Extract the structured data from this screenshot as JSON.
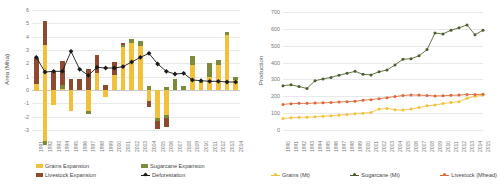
{
  "colors": {
    "grains": "#F2C13C",
    "sugarcane": "#7B8B3C",
    "livestock": "#8E4A2E",
    "deforestation": "#1a1a1a",
    "grains_line": "#F2C13C",
    "sugarcane_line": "#4A5D2B",
    "livestock_line": "#E0663A",
    "grid": "#e9e9e9",
    "axis_text": "#777777"
  },
  "left_chart": {
    "ylabel": "Area (Mha)",
    "legend": [
      {
        "label": "Grains Expansion",
        "marker": "square",
        "color": "#F2C13C"
      },
      {
        "label": "Sugarcane Expansion",
        "marker": "square",
        "color": "#7B8B3C"
      },
      {
        "label": "Livestock Expansion",
        "marker": "square",
        "color": "#8E4A2E"
      },
      {
        "label": "Deforestation",
        "marker": "diamond-line",
        "color": "#1a1a1a"
      }
    ]
  },
  "right_chart": {
    "ylabel": "Production",
    "legend": [
      {
        "label": "Grains (Mt)",
        "marker": "line",
        "color": "#F2C13C"
      },
      {
        "label": "Sugarcane (Mt)",
        "marker": "line",
        "color": "#4A5D2B"
      },
      {
        "label": "Livestock (Mhead)",
        "marker": "line",
        "color": "#E0663A"
      }
    ]
  },
  "chart_data": [
    {
      "type": "bar",
      "title": "",
      "id": "left",
      "xlabel": "",
      "ylabel": "Area (Mha)",
      "ylim": [
        -3,
        6
      ],
      "yticks": [
        6,
        5,
        4,
        3,
        2,
        1,
        0,
        -1,
        -2,
        -3
      ],
      "grid": true,
      "stacked": true,
      "legend_position": "bottom",
      "categories": [
        "1991",
        "1992",
        "1993",
        "1994",
        "1995",
        "1996",
        "1997",
        "1998",
        "1999",
        "2000",
        "2001",
        "2002",
        "2003",
        "2004",
        "2005",
        "2006",
        "2007",
        "2008",
        "2009",
        "2010",
        "2011",
        "2012",
        "2013",
        "2014"
      ],
      "series": [
        {
          "name": "Grains Expansion",
          "color": "#F2C13C",
          "values": [
            0.45,
            3.4,
            0.0,
            0.1,
            0.0,
            0.0,
            0.0,
            1.3,
            0.0,
            1.1,
            3.2,
            3.55,
            3.3,
            0.0,
            0.0,
            0.0,
            0.0,
            0.0,
            1.9,
            0.55,
            0.95,
            1.9,
            4.15,
            0.75
          ]
        },
        {
          "name": "Grains Negative",
          "color": "#F2C13C",
          "negative": true,
          "values": [
            -0.1,
            -3.85,
            -1.15,
            0.0,
            -1.55,
            0.0,
            -1.6,
            0.0,
            -0.55,
            0.0,
            0.0,
            0.0,
            0.0,
            -0.85,
            -2.1,
            -1.85,
            0.0,
            0.0,
            0.0,
            0.0,
            0.0,
            0.0,
            0.0,
            0.0
          ]
        },
        {
          "name": "Sugarcane Expansion",
          "color": "#7B8B3C",
          "values": [
            0.0,
            0.0,
            0.0,
            0.3,
            0.0,
            0.0,
            0.0,
            0.0,
            0.0,
            0.0,
            0.18,
            0.25,
            0.35,
            0.3,
            0.0,
            0.2,
            0.85,
            0.3,
            0.65,
            0.2,
            1.05,
            0.32,
            0.18,
            0.22
          ]
        },
        {
          "name": "Sugarcane Negative",
          "color": "#7B8B3C",
          "negative": true,
          "values": [
            0.0,
            -0.28,
            0.0,
            0.0,
            0.0,
            0.0,
            -0.22,
            0.0,
            0.0,
            0.0,
            0.0,
            0.0,
            0.0,
            0.0,
            -0.25,
            -0.22,
            0.0,
            0.0,
            0.0,
            0.0,
            0.0,
            0.0,
            0.0,
            0.0
          ]
        },
        {
          "name": "Livestock Expansion",
          "color": "#8E4A2E",
          "values": [
            1.95,
            1.8,
            1.45,
            1.75,
            0.85,
            0.8,
            1.6,
            1.35,
            0.35,
            1.0,
            0.15,
            0.0,
            0.0,
            0.0,
            0.0,
            0.0,
            0.0,
            0.0,
            0.0,
            0.0,
            0.0,
            0.0,
            0.0,
            0.0
          ]
        },
        {
          "name": "Livestock Negative",
          "color": "#8E4A2E",
          "negative": true,
          "values": [
            0.0,
            0.0,
            0.0,
            0.0,
            0.0,
            0.0,
            0.0,
            0.0,
            0.0,
            0.0,
            0.0,
            0.0,
            0.0,
            -0.45,
            -0.55,
            -0.7,
            0.0,
            0.0,
            0.0,
            0.0,
            0.0,
            0.0,
            0.0,
            0.0
          ]
        }
      ],
      "line_series": {
        "name": "Deforestation",
        "color": "#1a1a1a",
        "values": [
          2.45,
          1.35,
          1.4,
          1.4,
          2.9,
          1.55,
          1.1,
          1.7,
          1.65,
          1.65,
          1.75,
          2.1,
          2.45,
          2.75,
          1.95,
          1.4,
          1.2,
          1.25,
          0.75,
          0.7,
          0.65,
          0.65,
          0.6,
          0.6
        ]
      }
    },
    {
      "type": "line",
      "id": "right",
      "title": "",
      "xlabel": "",
      "ylabel": "Production",
      "ylim": [
        0,
        700
      ],
      "yticks": [
        0,
        100,
        200,
        300,
        400,
        500,
        600,
        700
      ],
      "grid": true,
      "legend_position": "bottom",
      "x": [
        "1990",
        "1991",
        "1992",
        "1993",
        "1994",
        "1995",
        "1996",
        "1997",
        "1998",
        "1999",
        "2000",
        "2001",
        "2002",
        "2003",
        "2004",
        "2005",
        "2006",
        "2007",
        "2008",
        "2009",
        "2010",
        "2011",
        "2012",
        "2013",
        "2014",
        "2015"
      ],
      "series": [
        {
          "name": "Grains (Mt)",
          "color": "#F2C13C",
          "values": [
            68,
            73,
            75,
            76,
            78,
            82,
            84,
            88,
            92,
            97,
            100,
            104,
            124,
            128,
            120,
            118,
            124,
            134,
            144,
            148,
            157,
            163,
            168,
            188,
            200,
            208
          ]
        },
        {
          "name": "Sugarcane (Mt)",
          "color": "#4A5D2B",
          "values": [
            263,
            268,
            258,
            246,
            292,
            303,
            312,
            325,
            336,
            348,
            330,
            327,
            345,
            356,
            386,
            420,
            423,
            440,
            477,
            575,
            570,
            592,
            606,
            623,
            565,
            592,
            660,
            635
          ]
        },
        {
          "name": "Livestock (Mhead)",
          "color": "#E0663A",
          "values": [
            152,
            156,
            158,
            158,
            160,
            161,
            163,
            166,
            168,
            170,
            177,
            180,
            186,
            192,
            198,
            205,
            208,
            207,
            205,
            202,
            203,
            206,
            207,
            211,
            210,
            212
          ]
        }
      ]
    }
  ]
}
